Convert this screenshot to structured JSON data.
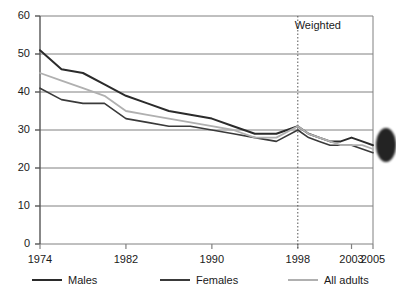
{
  "chart_data": {
    "type": "line",
    "title": "",
    "xlabel": "",
    "ylabel": "",
    "ylim": [
      0,
      60
    ],
    "xlim": [
      1974,
      2005
    ],
    "grid": true,
    "legend_position": "bottom",
    "ytick_labels": [
      "0",
      "10",
      "20",
      "30",
      "40",
      "50",
      "60"
    ],
    "ytick_values": [
      0,
      10,
      20,
      30,
      40,
      50,
      60
    ],
    "xtick_labels": [
      "1974",
      "1982",
      "1990",
      "1998",
      "2003",
      "2005"
    ],
    "xtick_values": [
      1974,
      1982,
      1990,
      1998,
      2003,
      2005
    ],
    "annotations": [
      {
        "text": "Weighted",
        "x": 2000.5,
        "y": 57
      }
    ],
    "reference_line": {
      "x": 1998,
      "style": "dotted",
      "label": "Weighted"
    },
    "series": [
      {
        "name": "Males",
        "color": "#2b2b2b",
        "width": 2.0,
        "x": [
          1974,
          1976,
          1978,
          1980,
          1982,
          1984,
          1986,
          1988,
          1990,
          1992,
          1994,
          1996,
          1998,
          1999,
          2000,
          2001,
          2002,
          2003,
          2004,
          2005
        ],
        "values": [
          51,
          46,
          45,
          42,
          39,
          37,
          35,
          34,
          33,
          31,
          29,
          29,
          31,
          29,
          28,
          27,
          27,
          28,
          27,
          26
        ]
      },
      {
        "name": "Females",
        "color": "#3a3a3a",
        "width": 1.6,
        "x": [
          1974,
          1976,
          1978,
          1980,
          1982,
          1984,
          1986,
          1988,
          1990,
          1992,
          1994,
          1996,
          1998,
          1999,
          2000,
          2001,
          2002,
          2003,
          2004,
          2005
        ],
        "values": [
          41,
          38,
          37,
          37,
          33,
          32,
          31,
          31,
          30,
          29,
          28,
          27,
          30,
          28,
          27,
          26,
          26,
          26,
          25,
          24
        ]
      },
      {
        "name": "All adults",
        "color": "#b0b0b0",
        "width": 1.8,
        "x": [
          1974,
          1976,
          1978,
          1980,
          1982,
          1984,
          1986,
          1988,
          1990,
          1992,
          1994,
          1996,
          1998,
          1999,
          2000,
          2001,
          2002,
          2003,
          2004,
          2005
        ],
        "values": [
          45,
          43,
          41,
          39,
          35,
          34,
          33,
          32,
          31,
          30,
          28,
          28,
          31,
          29,
          28,
          27,
          26,
          26,
          26,
          25
        ]
      }
    ]
  },
  "legend": {
    "items": [
      {
        "label": "Males",
        "color": "#2b2b2b"
      },
      {
        "label": "Females",
        "color": "#3a3a3a"
      },
      {
        "label": "All adults",
        "color": "#b0b0b0"
      }
    ]
  }
}
